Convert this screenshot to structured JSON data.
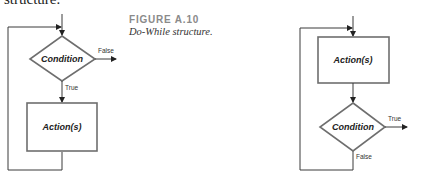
{
  "page": {
    "top_caption_fragment": "structure."
  },
  "figure": {
    "number": "FIGURE A.10",
    "title": "Do-While structure."
  },
  "diagrams": {
    "left": {
      "condition_label": "Condition",
      "false_label": "False",
      "true_label": "True",
      "action_label": "Action(s)"
    },
    "right": {
      "action_label": "Action(s)",
      "condition_label": "Condition",
      "true_label": "True",
      "false_label": "False"
    }
  },
  "colors": {
    "line": "#3a3a3a",
    "box_stroke": "#6e6e6e",
    "figure_number": "#8a8a8a"
  }
}
